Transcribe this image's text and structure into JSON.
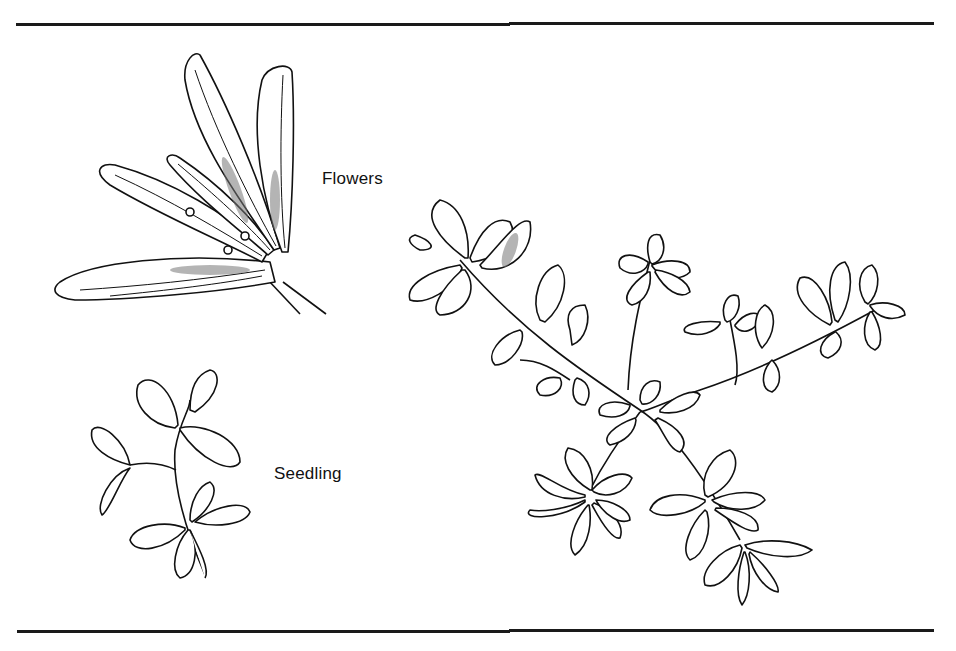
{
  "figure": {
    "labels": {
      "flowers": "Flowers",
      "seedling": "Seedling"
    },
    "panels": [
      {
        "id": "flowers",
        "description": "Leaf cluster with small flowers at leaf axils"
      },
      {
        "id": "seedling",
        "description": "Young seedling with paired rounded leaves"
      },
      {
        "id": "mature-plant",
        "description": "Mature branching plant with opposite serrated leaves"
      }
    ],
    "colors": {
      "ink": "#111111",
      "background": "#ffffff",
      "stipple": "#777777"
    }
  }
}
